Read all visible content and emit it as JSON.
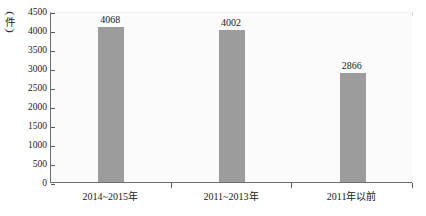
{
  "chart_data": {
    "type": "bar",
    "title": "",
    "subtitle": "",
    "xlabel": "",
    "ylabel": "件",
    "ylabel_display": "(件)",
    "categories": [
      "2014~2015年",
      "2011~2013年",
      "2011年以前"
    ],
    "values": [
      4068,
      4002,
      2866
    ],
    "value_labels": [
      "4068",
      "4002",
      "2866"
    ],
    "ylim": [
      0,
      4500
    ],
    "ytick_step": 500,
    "ytick_labels": [
      "4500",
      "4000",
      "3500",
      "3000",
      "2500",
      "2000",
      "1500",
      "1000",
      "500",
      "0"
    ],
    "ytick_values": [
      4500,
      4000,
      3500,
      3000,
      2500,
      2000,
      1500,
      1000,
      500,
      0
    ],
    "grid": false,
    "legend": null,
    "legend_position": "none",
    "series": [
      {
        "name": "",
        "values": [
          4068,
          4002,
          2866
        ]
      }
    ],
    "colors": {
      "bar": "#9c9c9c",
      "plot_background": "#fbfbfb",
      "axis": "#6d6d6d",
      "text": "#1a1a1a",
      "page_background": "#ffffff"
    },
    "annotations": []
  },
  "axis": {
    "y_unit_open_paren": "(",
    "y_unit_char": "件",
    "y_unit_close_paren": ")"
  }
}
